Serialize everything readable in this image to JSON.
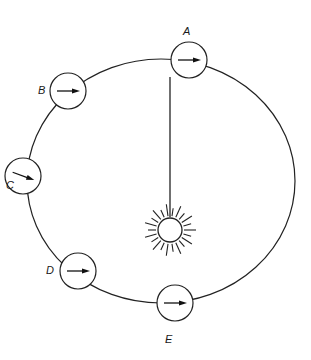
{
  "diagram": {
    "type": "orbit-diagram",
    "orbit": {
      "cx": 161,
      "cy": 181,
      "rx": 134,
      "ry": 122
    },
    "sun": {
      "cx": 170,
      "cy": 230,
      "r": 12,
      "ray_inner": 14,
      "ray_outer": 25,
      "ray_count": 22
    },
    "sun_link": {
      "x1": 170,
      "y1": 77,
      "x2": 170,
      "y2": 217
    },
    "positions": [
      {
        "id": "A",
        "label": "A",
        "cx": 189,
        "cy": 60,
        "r": 18,
        "arrow_angle": 0,
        "label_x": 183,
        "label_y": 26
      },
      {
        "id": "B",
        "label": "B",
        "cx": 68,
        "cy": 91,
        "r": 18,
        "arrow_angle": 0,
        "label_x": 38,
        "label_y": 85
      },
      {
        "id": "C",
        "label": "C",
        "cx": 23,
        "cy": 176,
        "r": 18,
        "arrow_angle": 20,
        "label_x": 6,
        "label_y": 180
      },
      {
        "id": "D",
        "label": "D",
        "cx": 78,
        "cy": 271,
        "r": 18,
        "arrow_angle": 0,
        "label_x": 46,
        "label_y": 265
      },
      {
        "id": "E",
        "label": "E",
        "cx": 175,
        "cy": 303,
        "r": 18,
        "arrow_angle": 0,
        "label_x": 165,
        "label_y": 334
      }
    ]
  }
}
